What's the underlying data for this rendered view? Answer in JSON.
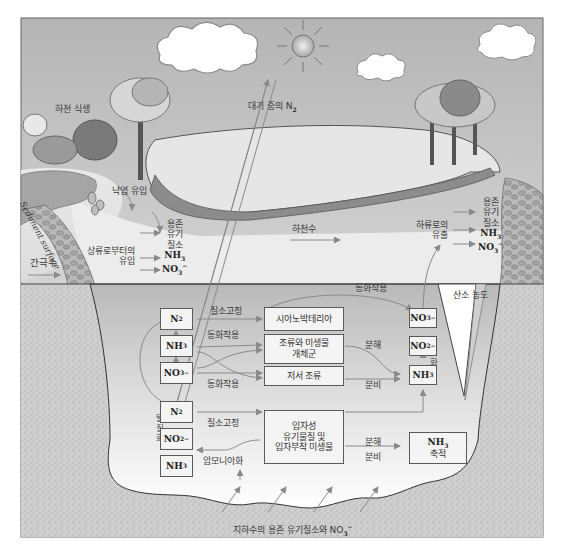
{
  "diagram": {
    "type": "nitrogen-cycle-in-stream",
    "labels": {
      "riparian_vegetation": "하천 식생",
      "atmospheric_n2": "대기 중의 N",
      "atmospheric_n2_sub": "2",
      "litter_input": "낙엽 유입",
      "sediment_surface": "Sediment surface",
      "upstream_input": "상류로부터의\n유입",
      "upstream_input_l1": "상류로부터의",
      "upstream_input_l2": "유입",
      "interstitial_water": "간극수",
      "stream_water": "하천수",
      "downstream_export_l1": "하류로의",
      "downstream_export_l2": "유출",
      "oxygen_concentration": "산소 농도",
      "nitrification": "질산화",
      "denitrification": "탈질화",
      "ammonification": "암모니아화",
      "groundwater_input": "지하수의 용존 유기질소와 NO",
      "groundwater_input_sub": "3",
      "groundwater_input_sup": "−"
    },
    "inflow_species": [
      "용존",
      "유기",
      "질소",
      "NH3",
      "NO3−"
    ],
    "outflow_species": [
      "용존",
      "유기",
      "질소",
      "NH3",
      "NO3−"
    ],
    "chem": {
      "n2": "N",
      "n2_sub": "2",
      "nh3": "NH",
      "nh3_sub": "3",
      "no3": "NO",
      "no3_sub": "3",
      "no3_sup": "−",
      "no2": "NO",
      "no2_sub": "2",
      "no2_sup": "−"
    },
    "boxes": {
      "cyanobacteria": "시아노박테리아",
      "algae_microbes_l1": "조류와 미생물",
      "algae_microbes_l2": "개체군",
      "benthic_algae": "저서 조류",
      "particulate_l1": "입자성",
      "particulate_l2": "유기물질 및",
      "particulate_l3": "입자부착 미생물",
      "nh3_storage_l1": "NH",
      "nh3_storage_sub": "3",
      "nh3_storage_l2": "축적"
    },
    "process_labels": {
      "n_fixation_1": "질소고정",
      "assimilation_top": "동화작용",
      "assimilation_1": "동화작용",
      "assimilation_2": "동화작용",
      "decomposition_1": "분해",
      "excretion_1": "분비",
      "n_fixation_2": "질소고정",
      "decomposition_2": "분해",
      "excretion_2": "분비"
    },
    "colors": {
      "sky_top": "#b8b8b8",
      "sky_bottom": "#efefef",
      "water": "#bdbdbd",
      "water_light": "#f2f2f2",
      "sediment": "#cfcfcf",
      "box_fill": "#f4f4f4",
      "box_border": "#5a5a5a",
      "arrow": "#8a8a8a"
    }
  }
}
